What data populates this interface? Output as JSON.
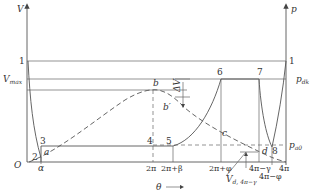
{
  "axes": {
    "left_axis_label": "V",
    "right_axis_label": "p",
    "x_axis_label": "θ",
    "x_arrow": "⟶",
    "origin_label": "O"
  },
  "levels": {
    "one_left": "1",
    "one_right": "1",
    "vmax": "V",
    "vmax_sub": "max",
    "pdk": "p",
    "pdk_sub": "dk",
    "pa0": "p",
    "pa0_sub": "a0"
  },
  "x_ticks": {
    "alpha": "α",
    "two_pi": "2π",
    "two_pi_beta": "2π+β",
    "two_pi_phi": "2π+φ",
    "four_pi_gamma": "4π−γ",
    "four_pi_phi": "4π−φ",
    "four_pi": "4π"
  },
  "points": {
    "p1": "1",
    "p2": "2",
    "p3": "3",
    "p4": "4",
    "p5": "5",
    "p6": "6",
    "p7": "7",
    "p8": "8",
    "a": "a",
    "b": "b",
    "b_prime": "b′",
    "c": "c",
    "d": "d"
  },
  "annotations": {
    "delta_v": "ΔV",
    "vd_label": "V",
    "vd_sub": "d, 4π−γ"
  }
}
